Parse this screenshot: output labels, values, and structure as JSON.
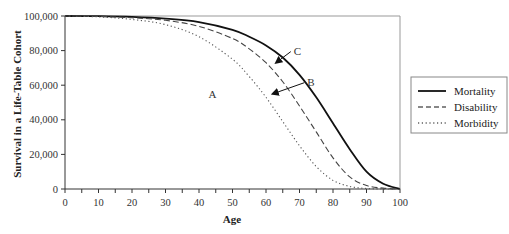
{
  "chart_data": {
    "type": "line",
    "title": "",
    "xlabel": "Age",
    "ylabel": "Survival in a Life-Table Cohort",
    "xlim": [
      0,
      100
    ],
    "ylim": [
      0,
      100000
    ],
    "xticks": [
      0,
      10,
      20,
      30,
      40,
      50,
      60,
      70,
      80,
      90,
      100
    ],
    "xtick_labels": [
      "0",
      "10",
      "20",
      "30",
      "40",
      "50",
      "60",
      "70",
      "80",
      "90",
      "100"
    ],
    "yticks": [
      0,
      20000,
      40000,
      60000,
      80000,
      100000
    ],
    "ytick_labels": [
      "0",
      "20,000",
      "40,000",
      "60,000",
      "80,000",
      "100,000"
    ],
    "grid": false,
    "legend_position": "right",
    "x": [
      0,
      10,
      20,
      30,
      40,
      50,
      55,
      60,
      65,
      70,
      75,
      80,
      85,
      90,
      95,
      100
    ],
    "series": [
      {
        "name": "Mortality",
        "style": "solid",
        "color": "#111111",
        "values": [
          100000,
          99900,
          99500,
          98500,
          96500,
          92000,
          88000,
          83000,
          76000,
          66000,
          53000,
          38000,
          23000,
          10000,
          3000,
          0
        ]
      },
      {
        "name": "Disability",
        "style": "dashed",
        "color": "#444444",
        "values": [
          100000,
          99800,
          99000,
          97500,
          94000,
          87000,
          81000,
          73000,
          62000,
          48000,
          33000,
          18000,
          7000,
          2000,
          500,
          0
        ]
      },
      {
        "name": "Morbidity",
        "style": "dotted",
        "color": "#555555",
        "values": [
          100000,
          99500,
          98000,
          95000,
          88000,
          75000,
          65000,
          53000,
          39000,
          25000,
          13000,
          5000,
          1500,
          300,
          0,
          0
        ]
      }
    ],
    "annotations": [
      {
        "text": "A",
        "x": 44,
        "y": 55000
      },
      {
        "text": "B",
        "x": 72,
        "y": 62000,
        "arrow_to": [
          62,
          55000
        ]
      },
      {
        "text": "C",
        "x": 68,
        "y": 80000,
        "arrow_to": [
          63,
          73000
        ]
      }
    ]
  },
  "legend": {
    "items": [
      {
        "label": "Mortality",
        "style": "solid"
      },
      {
        "label": "Disability",
        "style": "dashed"
      },
      {
        "label": "Morbidity",
        "style": "dotted"
      }
    ]
  }
}
